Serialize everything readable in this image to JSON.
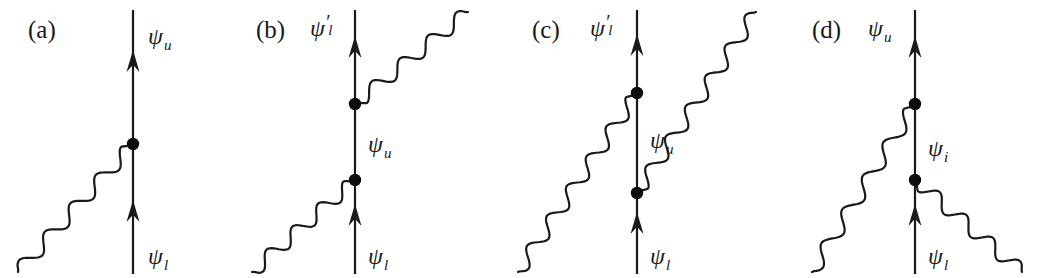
{
  "figure": {
    "background_color": "#ffffff",
    "ink_color": "#1a1a1a",
    "width": 1042,
    "height": 278
  },
  "panels": [
    {
      "id": "a",
      "label": "(a)",
      "label_x": 28,
      "label_y": 38,
      "axis_x": 133,
      "vertices": [
        {
          "name": "vertex-1",
          "x": 133,
          "y": 144
        }
      ],
      "arrows": [
        {
          "name": "arrow-up-upper",
          "x": 133,
          "y": 72
        },
        {
          "name": "arrow-up-lower",
          "x": 133,
          "y": 222
        }
      ],
      "labels": [
        {
          "name": "psi-upper",
          "symbol": "ψ",
          "prime": "",
          "sub": "u",
          "x": 148,
          "y": 44
        },
        {
          "name": "psi-lower",
          "symbol": "ψ",
          "prime": "",
          "sub": "l",
          "x": 148,
          "y": 264
        }
      ],
      "photons": [
        {
          "name": "photon-out-lower-left",
          "from_x": 133,
          "from_y": 144,
          "to_x": 18,
          "to_y": 272,
          "amp": 7,
          "waves": 4.5
        }
      ]
    },
    {
      "id": "b",
      "label": "(b)",
      "label_x": 256,
      "label_y": 38,
      "axis_x": 355,
      "vertices": [
        {
          "name": "vertex-1",
          "x": 355,
          "y": 104
        },
        {
          "name": "vertex-2",
          "x": 355,
          "y": 180
        }
      ],
      "arrows": [
        {
          "name": "arrow-up-upper",
          "x": 355,
          "y": 58
        },
        {
          "name": "arrow-up-lower",
          "x": 355,
          "y": 226
        }
      ],
      "labels": [
        {
          "name": "psi-upper",
          "symbol": "ψ",
          "prime": "′",
          "sub": "l",
          "x": 310,
          "y": 36
        },
        {
          "name": "psi-middle",
          "symbol": "ψ",
          "prime": "",
          "sub": "u",
          "x": 368,
          "y": 152
        },
        {
          "name": "psi-lower",
          "symbol": "ψ",
          "prime": "",
          "sub": "l",
          "x": 368,
          "y": 264
        }
      ],
      "photons": [
        {
          "name": "photon-out-upper-right",
          "from_x": 355,
          "from_y": 104,
          "to_x": 468,
          "to_y": 12,
          "amp": 7,
          "waves": 4.0
        },
        {
          "name": "photon-in-lower-left",
          "from_x": 355,
          "from_y": 180,
          "to_x": 252,
          "to_y": 272,
          "amp": 7,
          "waves": 4.0
        }
      ]
    },
    {
      "id": "c",
      "label": "(c)",
      "label_x": 532,
      "label_y": 38,
      "axis_x": 637,
      "vertices": [
        {
          "name": "vertex-1",
          "x": 637,
          "y": 93
        },
        {
          "name": "vertex-2",
          "x": 637,
          "y": 193
        }
      ],
      "arrows": [
        {
          "name": "arrow-up-upper",
          "x": 637,
          "y": 56
        },
        {
          "name": "arrow-up-lower",
          "x": 637,
          "y": 234
        }
      ],
      "labels": [
        {
          "name": "psi-upper",
          "symbol": "ψ",
          "prime": "′",
          "sub": "l",
          "x": 590,
          "y": 36
        },
        {
          "name": "psi-middle",
          "symbol": "ψ",
          "prime": "",
          "sub": "u",
          "x": 650,
          "y": 148
        },
        {
          "name": "psi-lower",
          "symbol": "ψ",
          "prime": "",
          "sub": "l",
          "x": 650,
          "y": 264
        }
      ],
      "photons": [
        {
          "name": "photon-out-lower-left",
          "from_x": 637,
          "from_y": 93,
          "to_x": 518,
          "to_y": 272,
          "amp": 7,
          "waves": 6.0
        },
        {
          "name": "photon-out-upper-right",
          "from_x": 637,
          "from_y": 193,
          "to_x": 756,
          "to_y": 12,
          "amp": 7,
          "waves": 6.0
        }
      ]
    },
    {
      "id": "d",
      "label": "(d)",
      "label_x": 812,
      "label_y": 38,
      "axis_x": 915,
      "vertices": [
        {
          "name": "vertex-1",
          "x": 915,
          "y": 104
        },
        {
          "name": "vertex-2",
          "x": 915,
          "y": 180
        }
      ],
      "arrows": [
        {
          "name": "arrow-up-upper",
          "x": 915,
          "y": 58
        },
        {
          "name": "arrow-up-lower",
          "x": 915,
          "y": 226
        }
      ],
      "labels": [
        {
          "name": "psi-upper",
          "symbol": "ψ",
          "prime": "",
          "sub": "u",
          "x": 868,
          "y": 36
        },
        {
          "name": "psi-middle",
          "symbol": "ψ",
          "prime": "",
          "sub": "i",
          "x": 928,
          "y": 156
        },
        {
          "name": "psi-lower",
          "symbol": "ψ",
          "prime": "",
          "sub": "l",
          "x": 928,
          "y": 264
        }
      ],
      "photons": [
        {
          "name": "photon-out-lower-left",
          "from_x": 915,
          "from_y": 104,
          "to_x": 812,
          "to_y": 272,
          "amp": 7,
          "waves": 5.0
        },
        {
          "name": "photon-out-lower-right",
          "from_x": 915,
          "from_y": 180,
          "to_x": 1022,
          "to_y": 272,
          "amp": 7,
          "waves": 4.0
        }
      ]
    }
  ],
  "geometry": {
    "line_top_y": 10,
    "line_bottom_y": 274,
    "vertex_radius": 6.2,
    "arrow_half_width": 6.5,
    "arrow_length": 22
  }
}
